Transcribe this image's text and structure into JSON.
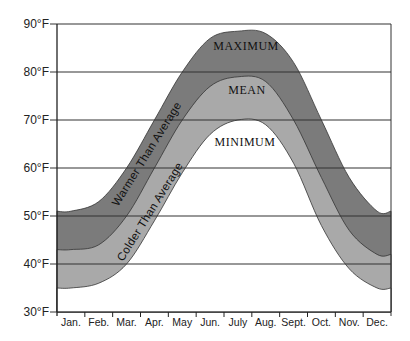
{
  "chart_data": {
    "type": "area",
    "title": "",
    "xlabel": "",
    "ylabel": "",
    "categories": [
      "Jan.",
      "Feb.",
      "Mar.",
      "Apr.",
      "May",
      "Jun.",
      "July",
      "Aug.",
      "Sept.",
      "Oct.",
      "Nov.",
      "Dec."
    ],
    "y_ticks": [
      "30°F",
      "40°F",
      "50°F",
      "60°F",
      "70°F",
      "80°F",
      "90°F"
    ],
    "ylim": [
      30,
      90
    ],
    "grid": "horizontal",
    "series": [
      {
        "name": "MAXIMUM",
        "values": [
          51,
          53,
          60,
          70,
          80,
          87,
          88.5,
          88,
          82,
          70,
          58,
          51
        ],
        "color": "#7a7a7a"
      },
      {
        "name": "MEAN",
        "values": [
          43,
          44,
          50,
          60,
          70,
          77,
          79,
          78,
          70,
          58,
          47,
          42
        ],
        "color": "#a8a8a8"
      },
      {
        "name": "MINIMUM",
        "values": [
          35,
          36,
          40,
          49,
          59,
          67,
          70,
          69,
          61,
          48,
          39,
          35
        ],
        "color": "#ffffff"
      }
    ],
    "annotations": [
      {
        "text": "Warmer Than Average",
        "region": "between MAXIMUM and MEAN"
      },
      {
        "text": "Colder Than Average",
        "region": "between MEAN and MINIMUM"
      }
    ]
  },
  "labels": {
    "maximum": "MAXIMUM",
    "mean": "MEAN",
    "minimum": "MINIMUM",
    "warmer": "Warmer Than Average",
    "colder": "Colder Than Average"
  },
  "colors": {
    "warm_band": "#7b7b7b",
    "cold_band": "#a9a9a9",
    "grid": "#333333",
    "background": "#ffffff"
  }
}
